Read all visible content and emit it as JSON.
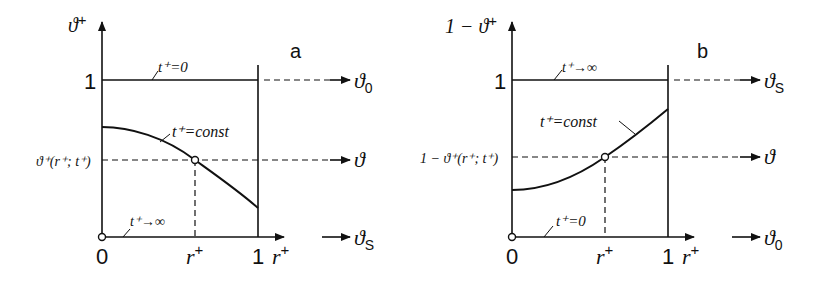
{
  "figure": {
    "panels": [
      {
        "id": "a",
        "panel_label": "a",
        "y_axis_label": "ϑ⁺",
        "x_axis_label": "r⁺",
        "y_tick_one": "1",
        "x_tick_zero": "0",
        "x_tick_one": "1",
        "x_marker_label": "r⁺",
        "y_marker_label": "ϑ⁺(r⁺; t⁺)",
        "top_line_label": "t⁺=0",
        "curve_label": "t⁺=const",
        "bottom_line_label": "t⁺→∞",
        "right_labels": {
          "top": "ϑ₀",
          "middle": "ϑ",
          "bottom": "ϑs"
        },
        "curve_shape": "decreasing from ~0.73 at r⁺=0 to ~0.14 at r⁺=1"
      },
      {
        "id": "b",
        "panel_label": "b",
        "y_axis_label": "1 − ϑ⁺",
        "x_axis_label": "r⁺",
        "y_tick_one": "1",
        "x_tick_zero": "0",
        "x_tick_one": "1",
        "x_marker_label": "r⁺",
        "y_marker_label": "1 − ϑ⁺(r⁺; t⁺)",
        "top_line_label": "t⁺→∞",
        "curve_label": "t⁺=const",
        "bottom_line_label": "t⁺=0",
        "right_labels": {
          "top": "ϑs",
          "middle": "ϑ",
          "bottom": "ϑ₀"
        },
        "curve_shape": "increasing from ~0.27 at r⁺=0 to ~0.86 at r⁺=1"
      }
    ]
  },
  "text": {
    "a_label": "a",
    "a_ylabel": "ϑ",
    "a_ylabel_sup": "+",
    "a_one": "1",
    "a_zero": "0",
    "a_xone": "1",
    "a_xlabel": "r",
    "a_xlabel_sup": "+",
    "a_rmark": "r",
    "a_rmark_sup": "+",
    "a_ymark": "ϑ⁺(r⁺; t⁺)",
    "a_top": "t⁺=0",
    "a_curve": "t⁺=const",
    "a_bottom": "t⁺→∞",
    "a_r_top": "ϑ",
    "a_r_top_sub": "0",
    "a_r_mid": "ϑ",
    "a_r_bot": "ϑ",
    "a_r_bot_sub": "S",
    "b_label": "b",
    "b_ylabel": "1 − ϑ",
    "b_ylabel_sup": "+",
    "b_one": "1",
    "b_zero": "0",
    "b_xone": "1",
    "b_xlabel": "r",
    "b_xlabel_sup": "+",
    "b_rmark": "r",
    "b_rmark_sup": "+",
    "b_ymark": "1 − ϑ⁺(r⁺; t⁺)",
    "b_top": "t⁺→∞",
    "b_curve": "t⁺=const",
    "b_bottom": "t⁺=0",
    "b_r_top": "ϑ",
    "b_r_top_sub": "S",
    "b_r_mid": "ϑ",
    "b_r_bot": "ϑ",
    "b_r_bot_sub": "0"
  }
}
